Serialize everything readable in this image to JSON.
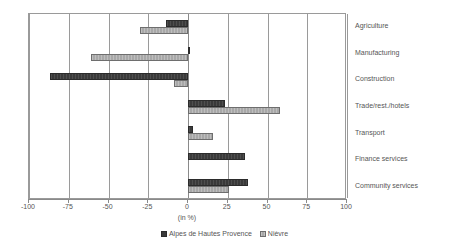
{
  "chart_data": {
    "type": "bar",
    "orientation": "horizontal",
    "title": "",
    "subtitle": "",
    "xlabel": "(in %)",
    "ylabel": "",
    "xlim": [
      -100,
      100
    ],
    "xticks": [
      -100,
      -75,
      -50,
      -25,
      0,
      25,
      50,
      75,
      100
    ],
    "xtick_labels": [
      "-100",
      "-75",
      "-50",
      "-25",
      "0",
      "25",
      "50",
      "75",
      "100"
    ],
    "grid": "vertical",
    "legend_position": "bottom-center",
    "categories": [
      "Agriculture",
      "Manufacturing",
      "Construction",
      "Trade/rest./hotels",
      "Transport",
      "Finance services",
      "Community services"
    ],
    "series": [
      {
        "name": "Alpes de Hautes Provence",
        "color": "#3a3a3a",
        "values": [
          -14,
          1,
          -87,
          23,
          3,
          36,
          38
        ]
      },
      {
        "name": "Nièvre",
        "color": "#a8a8a8",
        "values": [
          -30,
          -61,
          -9,
          58,
          16,
          0,
          26
        ]
      }
    ]
  },
  "legend": {
    "entries": [
      {
        "label": "Alpes de Hautes Provence"
      },
      {
        "label": "Nièvre"
      }
    ]
  }
}
